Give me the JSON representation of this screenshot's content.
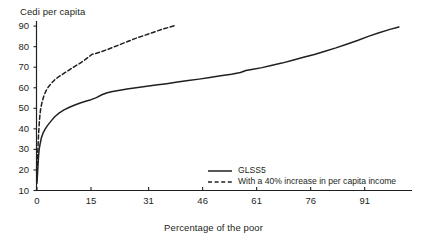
{
  "chart_data": {
    "type": "line",
    "title": "",
    "ylabel": "Cedi per capita",
    "xlabel": "Percentage of the poor",
    "xlim": [
      0,
      104
    ],
    "ylim": [
      10,
      92
    ],
    "grid": false,
    "legend_position": "bottom-right",
    "x_ticks": [
      {
        "value": 0,
        "label": "0"
      },
      {
        "value": 15,
        "label": "15"
      },
      {
        "value": 31,
        "label": "31"
      },
      {
        "value": 46,
        "label": "46"
      },
      {
        "value": 61,
        "label": "61"
      },
      {
        "value": 76,
        "label": "76"
      },
      {
        "value": 91,
        "label": "91"
      }
    ],
    "y_ticks": [
      {
        "value": 90,
        "label": "90"
      },
      {
        "value": 80,
        "label": "80"
      },
      {
        "value": 70,
        "label": "70"
      },
      {
        "value": 60,
        "label": "60"
      },
      {
        "value": 50,
        "label": "50"
      },
      {
        "value": 40,
        "label": "40"
      },
      {
        "value": 30,
        "label": "30"
      },
      {
        "value": 20,
        "label": "20"
      },
      {
        "value": 10,
        "label": "10"
      }
    ],
    "series": [
      {
        "name": "GLSS5",
        "style": "solid",
        "color": "#231f20",
        "points": [
          [
            0.0,
            13.5
          ],
          [
            0.2,
            20.0
          ],
          [
            0.4,
            26.0
          ],
          [
            0.6,
            30.0
          ],
          [
            0.9,
            33.0
          ],
          [
            1.2,
            35.5
          ],
          [
            1.7,
            38.0
          ],
          [
            2.3,
            40.0
          ],
          [
            3.0,
            41.8
          ],
          [
            4.0,
            44.0
          ],
          [
            5.0,
            46.0
          ],
          [
            6.2,
            47.8
          ],
          [
            7.5,
            49.2
          ],
          [
            9.0,
            50.5
          ],
          [
            10.5,
            51.6
          ],
          [
            12.0,
            52.6
          ],
          [
            13.5,
            53.4
          ],
          [
            15.0,
            54.2
          ],
          [
            16.5,
            55.2
          ],
          [
            18.0,
            56.6
          ],
          [
            19.5,
            57.6
          ],
          [
            21.0,
            58.2
          ],
          [
            23.0,
            58.8
          ],
          [
            25.0,
            59.4
          ],
          [
            27.5,
            60.0
          ],
          [
            30.0,
            60.6
          ],
          [
            33.0,
            61.3
          ],
          [
            36.0,
            62.0
          ],
          [
            39.0,
            62.8
          ],
          [
            42.0,
            63.5
          ],
          [
            45.0,
            64.2
          ],
          [
            48.0,
            65.0
          ],
          [
            51.0,
            65.8
          ],
          [
            54.0,
            66.6
          ],
          [
            56.5,
            67.4
          ],
          [
            58.0,
            68.4
          ],
          [
            60.0,
            69.0
          ],
          [
            62.5,
            69.8
          ],
          [
            65.0,
            70.8
          ],
          [
            68.0,
            72.0
          ],
          [
            71.0,
            73.4
          ],
          [
            74.0,
            74.8
          ],
          [
            77.0,
            76.2
          ],
          [
            80.0,
            77.8
          ],
          [
            83.0,
            79.4
          ],
          [
            86.0,
            81.2
          ],
          [
            89.0,
            83.0
          ],
          [
            92.0,
            85.0
          ],
          [
            95.0,
            86.8
          ],
          [
            98.0,
            88.4
          ],
          [
            100.5,
            89.6
          ]
        ]
      },
      {
        "name": "With a 40% increase in per capita income",
        "style": "dashed",
        "color": "#231f20",
        "points": [
          [
            0.0,
            19.0
          ],
          [
            0.2,
            28.0
          ],
          [
            0.4,
            36.0
          ],
          [
            0.6,
            42.0
          ],
          [
            0.8,
            46.5
          ],
          [
            1.0,
            49.5
          ],
          [
            1.4,
            53.0
          ],
          [
            1.9,
            56.0
          ],
          [
            2.5,
            58.5
          ],
          [
            3.2,
            60.5
          ],
          [
            4.0,
            62.2
          ],
          [
            5.0,
            64.0
          ],
          [
            6.2,
            65.6
          ],
          [
            7.0,
            66.4
          ],
          [
            8.0,
            67.6
          ],
          [
            9.2,
            69.0
          ],
          [
            10.5,
            70.4
          ],
          [
            11.8,
            71.8
          ],
          [
            13.0,
            73.2
          ],
          [
            14.2,
            74.8
          ],
          [
            15.2,
            76.2
          ],
          [
            16.5,
            76.8
          ],
          [
            18.0,
            77.6
          ],
          [
            19.5,
            78.6
          ],
          [
            21.0,
            79.6
          ],
          [
            23.0,
            81.0
          ],
          [
            25.0,
            82.4
          ],
          [
            27.0,
            83.8
          ],
          [
            29.0,
            85.0
          ],
          [
            31.0,
            86.2
          ],
          [
            33.0,
            87.4
          ],
          [
            35.0,
            88.6
          ],
          [
            37.0,
            89.6
          ],
          [
            38.5,
            90.4
          ]
        ]
      }
    ]
  },
  "legend": {
    "items": [
      {
        "label": "GLSS5",
        "style": "solid"
      },
      {
        "label": "With a 40% increase in per capita income",
        "style": "dashed"
      }
    ]
  }
}
